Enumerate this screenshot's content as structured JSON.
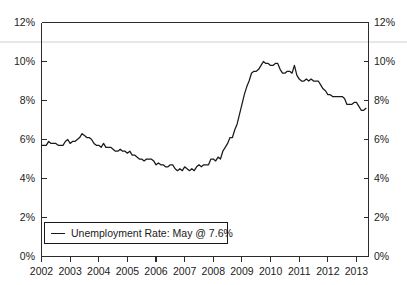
{
  "chart_data": {
    "type": "line",
    "title": "",
    "xlabel": "",
    "ylabel": "",
    "ylim": [
      0,
      12
    ],
    "xlim": [
      2002,
      2013.42
    ],
    "grid": false,
    "legend_position": "bottom-left",
    "y_tick_labels_left": [
      "12%",
      "10%",
      "8%",
      "6%",
      "4%",
      "2%",
      "0%"
    ],
    "y_tick_values_left": [
      12,
      10,
      8,
      6,
      4,
      2,
      0
    ],
    "y_tick_labels_right": [
      "12%",
      "10%",
      "8%",
      "6%",
      "4%",
      "2%",
      "0%"
    ],
    "y_tick_values_right": [
      12,
      10,
      8,
      6,
      4,
      2,
      0
    ],
    "x_tick_labels": [
      "2002",
      "2003",
      "2004",
      "2005",
      "2006",
      "2007",
      "2008",
      "2009",
      "2010",
      "2011",
      "2012",
      "2013"
    ],
    "x_tick_values": [
      2002,
      2003,
      2004,
      2005,
      2006,
      2007,
      2008,
      2009,
      2010,
      2011,
      2012,
      2013
    ],
    "series": [
      {
        "name": "Unemployment Rate",
        "color": "#1a1a1a",
        "last_value": 7.6,
        "last_period": "May",
        "x": [
          2002.0,
          2002.083,
          2002.167,
          2002.25,
          2002.333,
          2002.417,
          2002.5,
          2002.583,
          2002.667,
          2002.75,
          2002.833,
          2002.917,
          2003.0,
          2003.083,
          2003.167,
          2003.25,
          2003.333,
          2003.417,
          2003.5,
          2003.583,
          2003.667,
          2003.75,
          2003.833,
          2003.917,
          2004.0,
          2004.083,
          2004.167,
          2004.25,
          2004.333,
          2004.417,
          2004.5,
          2004.583,
          2004.667,
          2004.75,
          2004.833,
          2004.917,
          2005.0,
          2005.083,
          2005.167,
          2005.25,
          2005.333,
          2005.417,
          2005.5,
          2005.583,
          2005.667,
          2005.75,
          2005.833,
          2005.917,
          2006.0,
          2006.083,
          2006.167,
          2006.25,
          2006.333,
          2006.417,
          2006.5,
          2006.583,
          2006.667,
          2006.75,
          2006.833,
          2006.917,
          2007.0,
          2007.083,
          2007.167,
          2007.25,
          2007.333,
          2007.417,
          2007.5,
          2007.583,
          2007.667,
          2007.75,
          2007.833,
          2007.917,
          2008.0,
          2008.083,
          2008.167,
          2008.25,
          2008.333,
          2008.417,
          2008.5,
          2008.583,
          2008.667,
          2008.75,
          2008.833,
          2008.917,
          2009.0,
          2009.083,
          2009.167,
          2009.25,
          2009.333,
          2009.417,
          2009.5,
          2009.583,
          2009.667,
          2009.75,
          2009.833,
          2009.917,
          2010.0,
          2010.083,
          2010.167,
          2010.25,
          2010.333,
          2010.417,
          2010.5,
          2010.583,
          2010.667,
          2010.75,
          2010.833,
          2010.917,
          2011.0,
          2011.083,
          2011.167,
          2011.25,
          2011.333,
          2011.417,
          2011.5,
          2011.583,
          2011.667,
          2011.75,
          2011.833,
          2011.917,
          2012.0,
          2012.083,
          2012.167,
          2012.25,
          2012.333,
          2012.417,
          2012.5,
          2012.583,
          2012.667,
          2012.75,
          2012.833,
          2012.917,
          2013.0,
          2013.083,
          2013.167,
          2013.25,
          2013.333
        ],
        "values": [
          5.7,
          5.7,
          5.7,
          5.9,
          5.8,
          5.8,
          5.8,
          5.7,
          5.7,
          5.7,
          5.9,
          6.0,
          5.8,
          5.9,
          5.9,
          6.0,
          6.1,
          6.3,
          6.2,
          6.1,
          6.1,
          6.0,
          5.8,
          5.7,
          5.7,
          5.6,
          5.8,
          5.6,
          5.6,
          5.6,
          5.5,
          5.4,
          5.4,
          5.5,
          5.4,
          5.4,
          5.3,
          5.4,
          5.2,
          5.2,
          5.1,
          5.0,
          5.0,
          4.9,
          5.0,
          5.0,
          5.0,
          4.9,
          4.7,
          4.8,
          4.7,
          4.7,
          4.6,
          4.6,
          4.7,
          4.7,
          4.5,
          4.4,
          4.5,
          4.4,
          4.6,
          4.5,
          4.4,
          4.5,
          4.4,
          4.6,
          4.7,
          4.6,
          4.7,
          4.7,
          4.7,
          5.0,
          5.0,
          4.9,
          5.1,
          5.0,
          5.4,
          5.6,
          5.8,
          6.1,
          6.1,
          6.5,
          6.8,
          7.3,
          7.8,
          8.3,
          8.7,
          9.0,
          9.4,
          9.5,
          9.5,
          9.6,
          9.8,
          10.0,
          9.9,
          9.9,
          9.8,
          9.8,
          9.9,
          9.9,
          9.6,
          9.4,
          9.4,
          9.5,
          9.5,
          9.4,
          9.8,
          9.3,
          9.1,
          9.0,
          9.0,
          9.1,
          9.0,
          9.1,
          9.0,
          9.0,
          9.0,
          8.8,
          8.6,
          8.5,
          8.3,
          8.3,
          8.2,
          8.2,
          8.2,
          8.2,
          8.2,
          8.1,
          7.8,
          7.8,
          7.8,
          7.9,
          7.9,
          7.7,
          7.5,
          7.5,
          7.6
        ]
      }
    ]
  },
  "legend": {
    "entry_label": "Unemployment Rate: May @ 7.6%"
  },
  "colors": {
    "line": "#1a1a1a",
    "axis": "#2b2b2b",
    "background": "#ffffff",
    "artifact": "#e3e4e6"
  }
}
